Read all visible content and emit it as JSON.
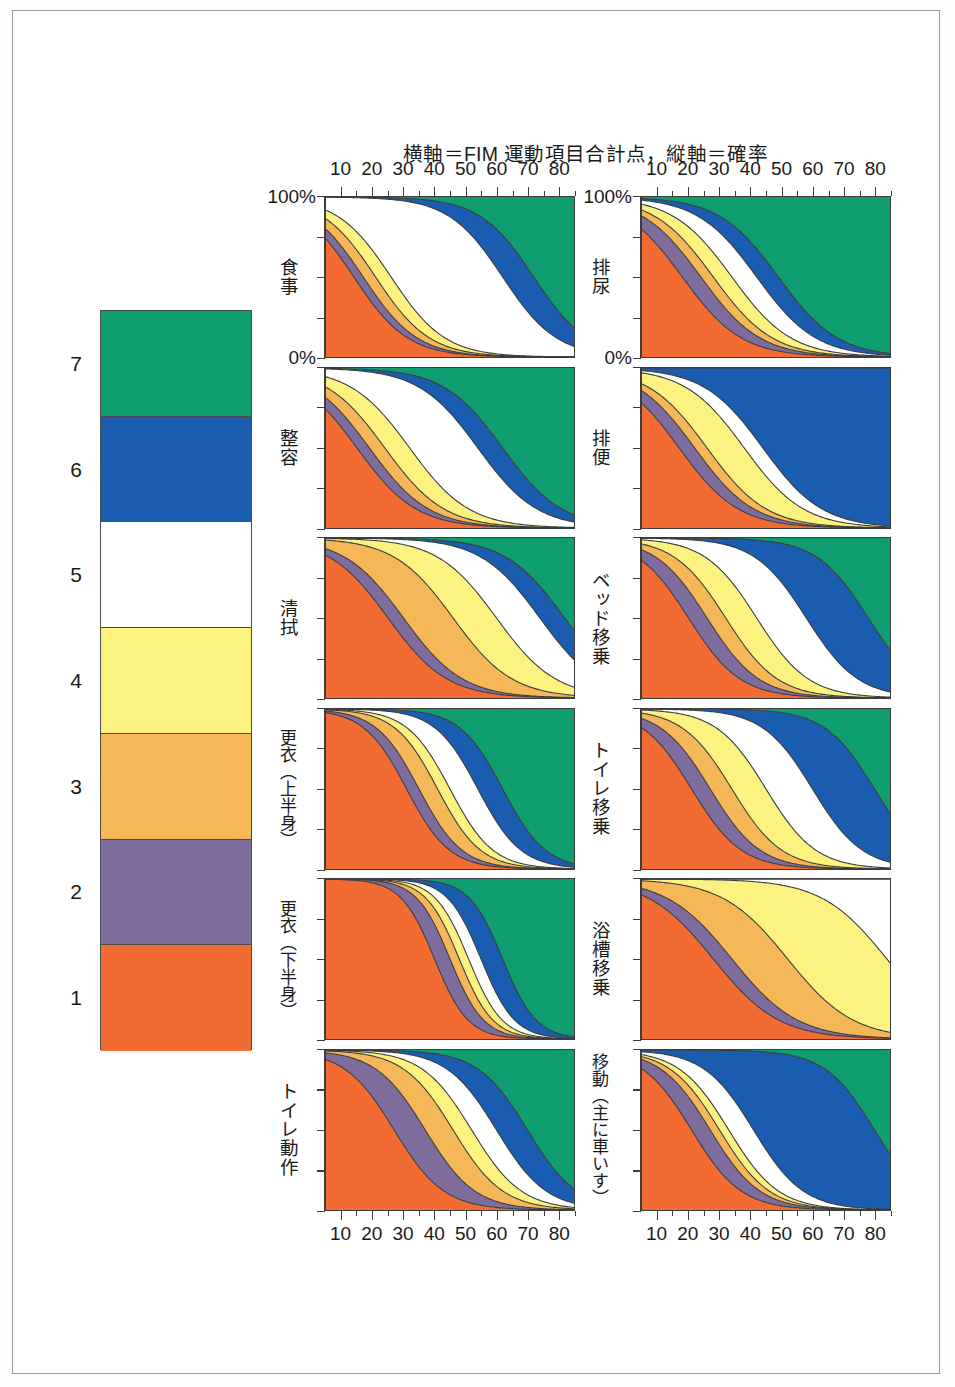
{
  "title": "横軸＝FIM 運動項目合計点，縦軸＝確率",
  "axis": {
    "x_ticks": [
      "10",
      "20",
      "30",
      "40",
      "50",
      "60",
      "70",
      "80"
    ],
    "x_min": 5,
    "x_max": 85,
    "y_top_label": "100%",
    "y_bottom_label": "0%",
    "y_min": 0,
    "y_max": 100
  },
  "legend": {
    "title": "FIM 項目得点",
    "items": [
      {
        "level": "7",
        "color": "#0f9e70"
      },
      {
        "level": "6",
        "color": "#1a5caf"
      },
      {
        "level": "5",
        "color": "#ffffff"
      },
      {
        "level": "4",
        "color": "#fbf280"
      },
      {
        "level": "3",
        "color": "#f5b757"
      },
      {
        "level": "2",
        "color": "#7e6d9c"
      },
      {
        "level": "1",
        "color": "#f26b32"
      }
    ]
  },
  "colors": {
    "level7": "#0f9e70",
    "level6": "#1a5caf",
    "level5": "#ffffff",
    "level4": "#fbf280",
    "level3": "#f5b757",
    "level2": "#7e6d9c",
    "level1": "#f26b32",
    "outline": "#3d3d3d",
    "frame": "#9a9a9a"
  },
  "chart_data": {
    "type": "area",
    "title": "横軸＝FIM 運動項目合計点，縦軸＝確率",
    "xlabel": "FIM 運動項目合計点",
    "ylabel": "確率",
    "xlim": [
      5,
      85
    ],
    "ylim": [
      0,
      100
    ],
    "grid": false,
    "legend_position": "left",
    "stack_order": [
      "1",
      "2",
      "3",
      "4",
      "5",
      "6",
      "7"
    ],
    "series_colors": [
      "#f26b32",
      "#7e6d9c",
      "#f5b757",
      "#fbf280",
      "#ffffff",
      "#1a5caf",
      "#0f9e70"
    ],
    "note": "Each panel is a cumulative stacked ordered-logit probability plot; bands are the probability of each FIM item score 1-7 as a function of the FIM motor total. 'slope' is the logistic steepness and 'thresholds' are the x-positions (FIM motor total) at which each cumulative boundary crosses 50%.",
    "panels": [
      {
        "id": "meal",
        "label": "食事",
        "column": "left",
        "slope": 0.115,
        "thresholds": [
          14,
          17,
          21,
          26,
          62,
          72
        ]
      },
      {
        "id": "grooming",
        "label": "整容",
        "column": "left",
        "slope": 0.105,
        "thresholds": [
          15,
          19,
          24,
          32,
          54,
          62
        ]
      },
      {
        "id": "bathing",
        "label": "清拭",
        "column": "left",
        "slope": 0.105,
        "thresholds": [
          25,
          30,
          46,
          60,
          74,
          82
        ]
      },
      {
        "id": "dressing-upper",
        "label": "更衣（上半身）",
        "column": "left",
        "slope": 0.145,
        "thresholds": [
          31,
          35,
          41,
          45,
          54,
          62
        ]
      },
      {
        "id": "dressing-lower",
        "label": "更衣（下半身）",
        "column": "left",
        "slope": 0.185,
        "thresholds": [
          40,
          45,
          48,
          51,
          55,
          62
        ]
      },
      {
        "id": "toileting",
        "label": "トイレ動作",
        "column": "left",
        "slope": 0.125,
        "thresholds": [
          27,
          37,
          46,
          52,
          60,
          70
        ]
      },
      {
        "id": "bladder",
        "label": "排尿",
        "column": "right",
        "slope": 0.105,
        "thresholds": [
          18,
          24,
          28,
          34,
          42,
          49
        ]
      },
      {
        "id": "bowel",
        "label": "排便",
        "column": "right",
        "slope": 0.105,
        "thresholds": [
          17,
          22,
          26,
          38,
          44,
          999
        ]
      },
      {
        "id": "bed-transfer",
        "label": "ベッド移乗",
        "column": "right",
        "slope": 0.12,
        "thresholds": [
          20,
          26,
          32,
          42,
          58,
          78
        ]
      },
      {
        "id": "toilet-transfer",
        "label": "トイレ移乗",
        "column": "right",
        "slope": 0.125,
        "thresholds": [
          21,
          27,
          34,
          45,
          60,
          80
        ]
      },
      {
        "id": "tub-transfer",
        "label": "浴槽移乗",
        "column": "right",
        "slope": 0.095,
        "thresholds": [
          28,
          34,
          52,
          84,
          999,
          999
        ]
      },
      {
        "id": "locomotion",
        "label": "移動（主に車いす）",
        "column": "right",
        "slope": 0.125,
        "thresholds": [
          21,
          27,
          30,
          33,
          41,
          80
        ]
      }
    ]
  }
}
